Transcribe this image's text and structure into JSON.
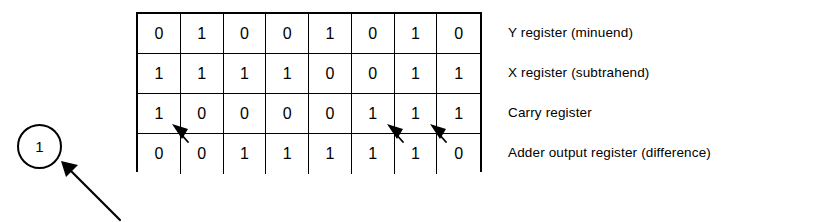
{
  "figure": {
    "background_color": "#ffffff",
    "line_color": "#000000"
  },
  "callout": {
    "number": "1",
    "shape": "circle",
    "arrow_icon": "arrow-up-left-icon",
    "arrow_from": [
      120,
      220
    ],
    "arrow_to": [
      14,
      14
    ]
  },
  "grid": {
    "columns": 8,
    "rows": [
      {
        "name": "y-register",
        "label": "Y register (minuend)",
        "bits": [
          "0",
          "1",
          "0",
          "0",
          "1",
          "0",
          "1",
          "0"
        ]
      },
      {
        "name": "x-register",
        "label": "X register (subtrahend)",
        "bits": [
          "1",
          "1",
          "1",
          "1",
          "0",
          "0",
          "1",
          "1"
        ]
      },
      {
        "name": "carry-register",
        "label": "Carry register",
        "bits": [
          "1",
          "0",
          "0",
          "0",
          "0",
          "1",
          "1",
          "1"
        ]
      },
      {
        "name": "adder-output-register",
        "label": "Adder output register (difference)",
        "bits": [
          "0",
          "0",
          "1",
          "1",
          "1",
          "1",
          "1",
          "0"
        ]
      }
    ]
  },
  "carry_arrows": {
    "icon": "arrow-up-left-icon",
    "count": 3,
    "positions_x": [
      44,
      259,
      302
    ],
    "positions_y": [
      120,
      120,
      120
    ],
    "description": "borrow-propagation arrows between carry register and adder output register"
  }
}
